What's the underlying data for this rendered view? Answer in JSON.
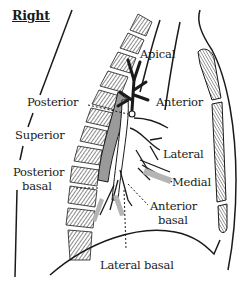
{
  "diagram": {
    "title": "Right",
    "colors": {
      "ink": "#1a1a1a",
      "shade": "#9a9a9a",
      "background": "#ffffff"
    },
    "labels": {
      "apical": "Apical",
      "posterior": "Posterior",
      "anterior": "Anterior",
      "superior": "Superior",
      "lateral": "Lateral",
      "posterior_basal_1": "Posterior",
      "posterior_basal_2": "basal",
      "medial": "Medial",
      "anterior_basal_1": "Anterior",
      "anterior_basal_2": "basal",
      "lateral_basal": "Lateral basal"
    }
  }
}
